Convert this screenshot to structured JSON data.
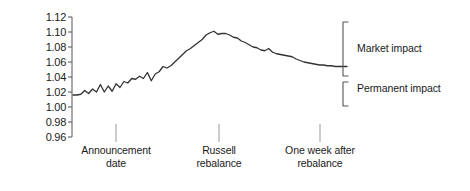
{
  "chart_data": {
    "type": "line",
    "title": "",
    "xlabel": "",
    "ylabel": "Price (normalized)",
    "ylim": [
      0.96,
      1.12
    ],
    "yticks": [
      "1.12",
      "1.10",
      "1.08",
      "1.06",
      "1.04",
      "1.02",
      "1.00",
      "0.98",
      "0.96"
    ],
    "ytick_values": [
      1.12,
      1.1,
      1.08,
      1.06,
      1.04,
      1.02,
      1.0,
      0.98,
      0.96
    ],
    "grid": false,
    "legend": "none",
    "xtick_labels": [
      "Announcement\ndate",
      "Russell\nrebalance",
      "One week after\nrebalance"
    ],
    "xtick_label_lines": [
      [
        "Announcement",
        "date"
      ],
      [
        "Russell",
        "rebalance"
      ],
      [
        "One week after",
        "rebalance"
      ]
    ],
    "xtick_positions": [
      11,
      38,
      62
    ],
    "x": [
      0,
      1,
      2,
      3,
      4,
      5,
      6,
      7,
      8,
      9,
      10,
      11,
      12,
      13,
      14,
      15,
      16,
      17,
      18,
      19,
      20,
      21,
      22,
      23,
      24,
      25,
      26,
      27,
      28,
      29,
      30,
      31,
      32,
      33,
      34,
      35,
      36,
      37,
      38,
      39,
      40,
      41,
      42,
      43,
      44,
      45,
      46,
      47,
      48,
      49,
      50,
      51,
      52,
      53,
      54,
      55,
      56,
      57,
      58,
      59,
      60,
      61,
      62,
      63,
      64,
      65,
      66,
      67,
      68,
      69,
      70
    ],
    "values": [
      1.016,
      1.016,
      1.017,
      1.022,
      1.018,
      1.024,
      1.02,
      1.03,
      1.02,
      1.028,
      1.021,
      1.031,
      1.026,
      1.034,
      1.032,
      1.038,
      1.037,
      1.041,
      1.038,
      1.046,
      1.035,
      1.044,
      1.047,
      1.054,
      1.052,
      1.055,
      1.06,
      1.065,
      1.07,
      1.075,
      1.078,
      1.082,
      1.086,
      1.09,
      1.096,
      1.099,
      1.101,
      1.097,
      1.098,
      1.098,
      1.096,
      1.093,
      1.092,
      1.088,
      1.086,
      1.083,
      1.08,
      1.079,
      1.076,
      1.075,
      1.078,
      1.073,
      1.071,
      1.07,
      1.069,
      1.068,
      1.067,
      1.064,
      1.062,
      1.06,
      1.059,
      1.058,
      1.057,
      1.056,
      1.056,
      1.055,
      1.055,
      1.054,
      1.054,
      1.054,
      1.054
    ],
    "annotations": [
      {
        "name": "market-impact",
        "label": "Market impact",
        "from": 1.101,
        "to": 1.054
      },
      {
        "name": "permanent-impact",
        "label": "Permanent impact",
        "from": 1.054,
        "to": 1.016
      }
    ],
    "series_color": "#333333"
  }
}
